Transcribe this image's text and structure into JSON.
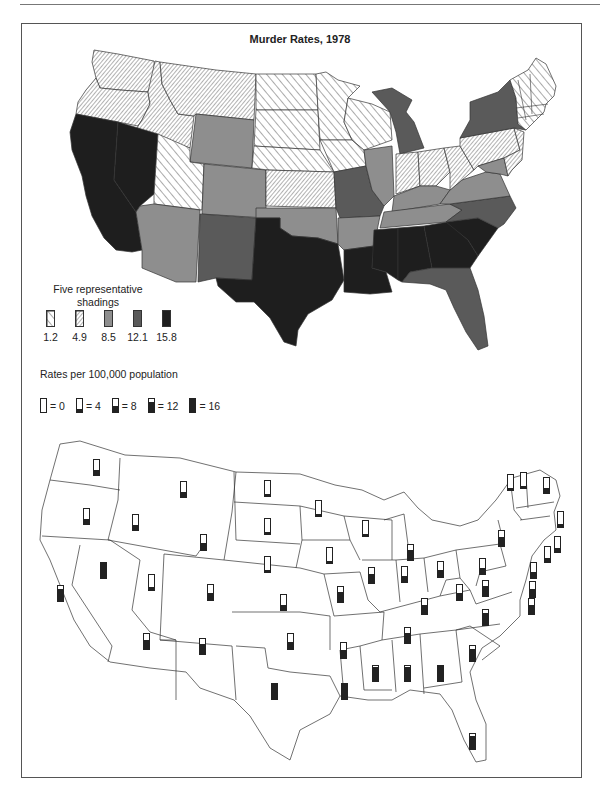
{
  "page": {
    "title": "Murder Rates, 1978"
  },
  "legend": {
    "shading_heading": "Five representative shadings",
    "shadings": [
      {
        "label": "1.2",
        "pattern": "sparse-hatch"
      },
      {
        "label": "4.9",
        "pattern": "dense-hatch"
      },
      {
        "label": "8.5",
        "pattern": "light-gray",
        "color": "#8e8e8e"
      },
      {
        "label": "12.1",
        "pattern": "dark-gray",
        "color": "#5a5a5a"
      },
      {
        "label": "15.8",
        "pattern": "black",
        "color": "#1e1e1e"
      }
    ],
    "rates_label": "Rates per 100,000 population",
    "bar_scale": [
      {
        "label": "= 0",
        "value": 0
      },
      {
        "label": "= 4",
        "value": 4
      },
      {
        "label": "= 8",
        "value": 8
      },
      {
        "label": "= 12",
        "value": 12
      },
      {
        "label": "= 16",
        "value": 16
      }
    ]
  },
  "chart_data": [
    {
      "type": "choropleth",
      "title": "Murder Rates, 1978",
      "legend_title": "Five representative shadings",
      "legend_values": [
        1.2,
        4.9,
        8.5,
        12.1,
        15.8
      ],
      "state_shading_class": {
        "WA": 4.9,
        "OR": 4.9,
        "ID": 4.9,
        "MT": 4.9,
        "WY": 8.5,
        "NV": 15.8,
        "CA": 15.8,
        "UT": 1.2,
        "CO": 8.5,
        "AZ": 8.5,
        "NM": 12.1,
        "ND": 1.2,
        "SD": 1.2,
        "NE": 1.2,
        "KS": 4.9,
        "OK": 8.5,
        "TX": 15.8,
        "MN": 1.2,
        "IA": 1.2,
        "MO": 12.1,
        "AR": 8.5,
        "LA": 15.8,
        "WI": 1.2,
        "IL": 8.5,
        "MI": 12.1,
        "IN": 4.9,
        "OH": 4.9,
        "KY": 8.5,
        "TN": 8.5,
        "MS": 15.8,
        "AL": 15.8,
        "GA": 15.8,
        "SC": 15.8,
        "NC": 12.1,
        "FL": 12.1,
        "VA": 8.5,
        "WV": 4.9,
        "PA": 4.9,
        "NY": 12.1,
        "NJ": 4.9,
        "MD": 8.5,
        "DE": 4.9,
        "ME": 1.2,
        "NH": 1.2,
        "VT": 1.2,
        "MA": 1.2,
        "CT": 1.2,
        "RI": 1.2
      }
    },
    {
      "type": "bar",
      "title": "Rates per 100,000 population",
      "scale": [
        0,
        4,
        8,
        12,
        16
      ],
      "categories": [
        "WA",
        "OR",
        "CA",
        "ID",
        "NV",
        "MT",
        "WY",
        "UT",
        "AZ",
        "CO",
        "NM",
        "ND",
        "SD",
        "NE",
        "KS",
        "OK",
        "TX",
        "MN",
        "IA",
        "MO",
        "AR",
        "LA",
        "WI",
        "IL",
        "MI",
        "IN",
        "OH",
        "KY",
        "TN",
        "MS",
        "AL",
        "GA",
        "SC",
        "NC",
        "FL",
        "VA",
        "WV",
        "PA",
        "NY",
        "VT",
        "NH",
        "ME",
        "MA",
        "RI",
        "CT",
        "NJ",
        "DE",
        "MD"
      ],
      "values": [
        5,
        5,
        13,
        5,
        16,
        5,
        7,
        3,
        10,
        7,
        11,
        2,
        2,
        2,
        5,
        8,
        16,
        2,
        2,
        11,
        9,
        16,
        2,
        10,
        11,
        6,
        7,
        10,
        11,
        15,
        15,
        16,
        13,
        13,
        14,
        11,
        7,
        6,
        10,
        2,
        2,
        5,
        3,
        4,
        4,
        6,
        9,
        10
      ],
      "ylim": [
        0,
        16
      ]
    }
  ],
  "bars": [
    {
      "state": "WA",
      "x": 93,
      "y": 459,
      "v": 5
    },
    {
      "state": "OR",
      "x": 83,
      "y": 508,
      "v": 5
    },
    {
      "state": "CA",
      "x": 57,
      "y": 585,
      "v": 13
    },
    {
      "state": "ID",
      "x": 132,
      "y": 514,
      "v": 5
    },
    {
      "state": "NV",
      "x": 100,
      "y": 562,
      "v": 16
    },
    {
      "state": "MT",
      "x": 180,
      "y": 481,
      "v": 5
    },
    {
      "state": "WY",
      "x": 200,
      "y": 534,
      "v": 7
    },
    {
      "state": "UT",
      "x": 148,
      "y": 574,
      "v": 3
    },
    {
      "state": "AZ",
      "x": 143,
      "y": 633,
      "v": 10
    },
    {
      "state": "CO",
      "x": 207,
      "y": 584,
      "v": 7
    },
    {
      "state": "NM",
      "x": 199,
      "y": 638,
      "v": 11
    },
    {
      "state": "ND",
      "x": 264,
      "y": 480,
      "v": 2
    },
    {
      "state": "SD",
      "x": 264,
      "y": 518,
      "v": 2
    },
    {
      "state": "NE",
      "x": 264,
      "y": 556,
      "v": 2
    },
    {
      "state": "KS",
      "x": 280,
      "y": 594,
      "v": 5
    },
    {
      "state": "OK",
      "x": 287,
      "y": 633,
      "v": 8
    },
    {
      "state": "TX",
      "x": 271,
      "y": 683,
      "v": 16
    },
    {
      "state": "MN",
      "x": 315,
      "y": 500,
      "v": 2
    },
    {
      "state": "IA",
      "x": 326,
      "y": 547,
      "v": 2
    },
    {
      "state": "MO",
      "x": 337,
      "y": 586,
      "v": 11
    },
    {
      "state": "AR",
      "x": 340,
      "y": 642,
      "v": 9
    },
    {
      "state": "LA",
      "x": 341,
      "y": 683,
      "v": 16
    },
    {
      "state": "WI",
      "x": 362,
      "y": 520,
      "v": 2
    },
    {
      "state": "IL",
      "x": 368,
      "y": 567,
      "v": 10
    },
    {
      "state": "MI",
      "x": 407,
      "y": 544,
      "v": 11
    },
    {
      "state": "IN",
      "x": 401,
      "y": 566,
      "v": 6
    },
    {
      "state": "OH",
      "x": 437,
      "y": 561,
      "v": 7
    },
    {
      "state": "KY",
      "x": 421,
      "y": 598,
      "v": 10
    },
    {
      "state": "TN",
      "x": 404,
      "y": 627,
      "v": 11
    },
    {
      "state": "MS",
      "x": 372,
      "y": 665,
      "v": 15
    },
    {
      "state": "AL",
      "x": 404,
      "y": 665,
      "v": 15
    },
    {
      "state": "GA",
      "x": 437,
      "y": 665,
      "v": 16
    },
    {
      "state": "SC",
      "x": 469,
      "y": 645,
      "v": 13
    },
    {
      "state": "NC",
      "x": 482,
      "y": 609,
      "v": 13
    },
    {
      "state": "FL",
      "x": 469,
      "y": 763,
      "v": 14,
      "fy": 733
    },
    {
      "state": "VA",
      "x": 482,
      "y": 580,
      "v": 11
    },
    {
      "state": "WV",
      "x": 456,
      "y": 584,
      "v": 7
    },
    {
      "state": "PA",
      "x": 479,
      "y": 558,
      "v": 6
    },
    {
      "state": "NY",
      "x": 498,
      "y": 530,
      "v": 10
    },
    {
      "state": "VT",
      "x": 507,
      "y": 474,
      "v": 2
    },
    {
      "state": "NH",
      "x": 520,
      "y": 472,
      "v": 2
    },
    {
      "state": "ME",
      "x": 543,
      "y": 477,
      "v": 5
    },
    {
      "state": "MA",
      "x": 557,
      "y": 511,
      "v": 3
    },
    {
      "state": "RI",
      "x": 554,
      "y": 536,
      "v": 4
    },
    {
      "state": "CT",
      "x": 544,
      "y": 546,
      "v": 4
    },
    {
      "state": "NJ",
      "x": 530,
      "y": 562,
      "v": 6
    },
    {
      "state": "DE",
      "x": 529,
      "y": 581,
      "v": 9
    },
    {
      "state": "MD",
      "x": 528,
      "y": 598,
      "v": 10
    }
  ]
}
